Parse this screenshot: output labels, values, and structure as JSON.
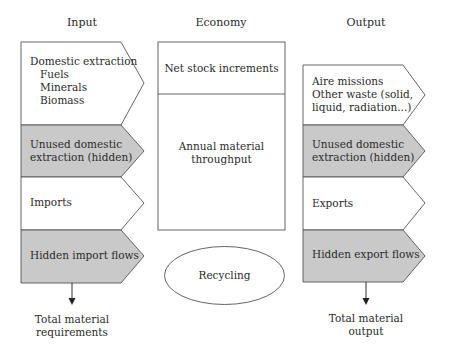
{
  "headers": {
    "input": "Input",
    "economy": "Economy",
    "output": "Output"
  },
  "input": {
    "blocks": [
      {
        "title": "Domestic extraction",
        "sub": [
          "Fuels",
          "Minerals",
          "Biomass"
        ],
        "shaded": false
      },
      {
        "lines": [
          "Unused domestic",
          "extraction (hidden)"
        ],
        "shaded": true
      },
      {
        "lines": [
          "Imports"
        ],
        "shaded": false
      },
      {
        "lines": [
          "Hidden import flows"
        ],
        "shaded": true
      }
    ],
    "total": [
      "Total material",
      "requirements"
    ]
  },
  "economy": {
    "top": "Net stock increments",
    "bottom": [
      "Annual material",
      "throughput"
    ],
    "recycling": "Recycling"
  },
  "output": {
    "blocks": [
      {
        "lines": [
          "Aire missions",
          "Other waste (solid,",
          "liquid, radiation...)"
        ],
        "shaded": false
      },
      {
        "lines": [
          "Unused domestic",
          "extraction (hidden)"
        ],
        "shaded": true
      },
      {
        "lines": [
          "Exports"
        ],
        "shaded": false
      },
      {
        "lines": [
          "Hidden export flows"
        ],
        "shaded": true
      }
    ],
    "total": [
      "Total material",
      "output"
    ]
  },
  "colors": {
    "shaded": "#c9c9c9",
    "line": "#555555",
    "white": "#ffffff"
  }
}
